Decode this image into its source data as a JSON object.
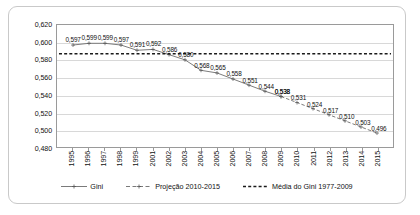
{
  "chart_data": {
    "type": "line",
    "title": "",
    "xlabel": "",
    "ylabel": "",
    "ylim": [
      0.48,
      0.62
    ],
    "ytick_step": 0.02,
    "grid": true,
    "legend_position": "bottom",
    "decimal_separator": ",",
    "categories": [
      "1995",
      "1996",
      "1997",
      "1998",
      "1999",
      "2001",
      "2002",
      "2003",
      "2004",
      "2005",
      "2006",
      "2007",
      "2008",
      "2009",
      "2010",
      "2011",
      "2012",
      "2013",
      "2014",
      "2015"
    ],
    "ytick_labels": [
      "0,620",
      "0,600",
      "0,580",
      "0,560",
      "0,540",
      "0,520",
      "0,500",
      "0,480"
    ],
    "ytick_values": [
      0.62,
      0.6,
      0.58,
      0.56,
      0.54,
      0.52,
      0.5,
      0.48
    ],
    "series": [
      {
        "name": "Gini",
        "style": "solid",
        "x": [
          "1995",
          "1996",
          "1997",
          "1998",
          "1999",
          "2001",
          "2002",
          "2003",
          "2004",
          "2005",
          "2006",
          "2007",
          "2008",
          "2009"
        ],
        "values": [
          0.597,
          0.599,
          0.599,
          0.597,
          0.591,
          0.592,
          0.586,
          0.58,
          0.568,
          0.565,
          0.558,
          0.551,
          0.544,
          0.538
        ],
        "labels": [
          "0,597",
          "0,599",
          "0,599",
          "0,597",
          "0,591",
          "0,592",
          "0,586",
          "0,580",
          "0,568",
          "0,565",
          "0,558",
          "0,551",
          "0,544",
          "0,538"
        ]
      },
      {
        "name": "Projeção 2010-2015",
        "style": "dashed",
        "x": [
          "2009",
          "2010",
          "2011",
          "2012",
          "2013",
          "2014",
          "2015"
        ],
        "values": [
          0.538,
          0.531,
          0.524,
          0.517,
          0.51,
          0.503,
          0.496
        ],
        "labels": [
          "0,538",
          "0,531",
          "0,524",
          "0,517",
          "0,510",
          "0,503",
          "0,496"
        ]
      },
      {
        "name": "Média do Gini 1977-2009",
        "style": "dotted",
        "type": "horizontal-reference",
        "value": 0.587
      }
    ],
    "legend": [
      {
        "label": "Gini",
        "style": "solid"
      },
      {
        "label": "Projeção 2010-2015",
        "style": "dashed"
      },
      {
        "label": "Média do Gini 1977-2009",
        "style": "dotted"
      }
    ]
  }
}
